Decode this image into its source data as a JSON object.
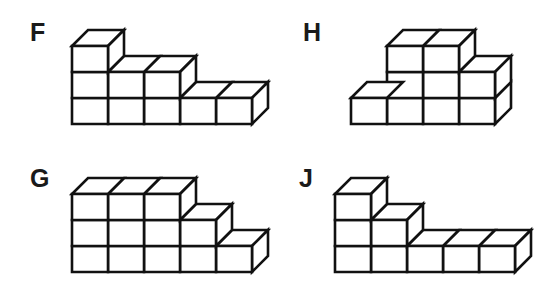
{
  "page": {
    "background_color": "#ffffff",
    "line_color": "#111111",
    "label_color": "#1a1a1a"
  },
  "figures": [
    {
      "id": "F",
      "label": "F",
      "position": "top-left",
      "column_heights": [
        3,
        2,
        2,
        1,
        1
      ],
      "columns": 5,
      "max_height": 3,
      "total_cubes": 9,
      "origin_x": 72,
      "baseline_y": 124,
      "cube_w": 36,
      "cube_h": 26,
      "depth_x": 16,
      "depth_y": 16,
      "label_x": 30,
      "label_y": 20
    },
    {
      "id": "H",
      "label": "H",
      "position": "top-right",
      "column_heights": [
        1,
        3,
        3,
        2
      ],
      "columns": 4,
      "max_height": 3,
      "total_cubes": 9,
      "origin_x": 78,
      "baseline_y": 124,
      "cube_w": 36,
      "cube_h": 26,
      "depth_x": 16,
      "depth_y": 16,
      "label_x": 30,
      "label_y": 20
    },
    {
      "id": "G",
      "label": "G",
      "position": "bottom-left",
      "column_heights": [
        3,
        3,
        3,
        2,
        1
      ],
      "columns": 5,
      "max_height": 3,
      "total_cubes": 12,
      "origin_x": 72,
      "baseline_y": 119,
      "cube_w": 36,
      "cube_h": 26,
      "depth_x": 16,
      "depth_y": 16,
      "label_x": 30,
      "label_y": 13
    },
    {
      "id": "J",
      "label": "J",
      "position": "bottom-right",
      "column_heights": [
        3,
        2,
        1,
        1,
        1
      ],
      "columns": 5,
      "max_height": 3,
      "total_cubes": 8,
      "origin_x": 62,
      "baseline_y": 119,
      "cube_w": 36,
      "cube_h": 26,
      "depth_x": 16,
      "depth_y": 16,
      "label_x": 26,
      "label_y": 13
    }
  ]
}
